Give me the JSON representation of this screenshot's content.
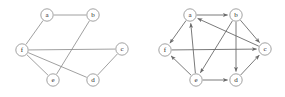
{
  "figure": {
    "width": 285,
    "height": 97,
    "background_color": "#ffffff",
    "edge_color": "#888888",
    "node_fill_color": "#ffffff",
    "node_stroke_color": "#8a8a8a",
    "label_color": "#2a2a2a",
    "node_radius": 6.2
  },
  "chart_data": {
    "type": "diagram",
    "panels": [
      {
        "id": "left",
        "name": "undirected-graph",
        "directed": false,
        "nodes": [
          {
            "id": "a",
            "label": "a",
            "x": 47,
            "y": 15
          },
          {
            "id": "b",
            "label": "b",
            "x": 93,
            "y": 15
          },
          {
            "id": "c",
            "label": "c",
            "x": 122,
            "y": 49
          },
          {
            "id": "d",
            "label": "d",
            "x": 93,
            "y": 80
          },
          {
            "id": "e",
            "label": "e",
            "x": 53,
            "y": 80
          },
          {
            "id": "f",
            "label": "f",
            "x": 22,
            "y": 50
          }
        ],
        "edges": [
          {
            "from": "a",
            "to": "b"
          },
          {
            "from": "a",
            "to": "f"
          },
          {
            "from": "b",
            "to": "e"
          },
          {
            "from": "f",
            "to": "c"
          },
          {
            "from": "f",
            "to": "e"
          },
          {
            "from": "f",
            "to": "d"
          },
          {
            "from": "c",
            "to": "d"
          }
        ]
      },
      {
        "id": "right",
        "name": "directed-graph",
        "directed": true,
        "nodes": [
          {
            "id": "a",
            "label": "a",
            "x": 190,
            "y": 15
          },
          {
            "id": "b",
            "label": "b",
            "x": 236,
            "y": 15
          },
          {
            "id": "c",
            "label": "c",
            "x": 265,
            "y": 49
          },
          {
            "id": "d",
            "label": "d",
            "x": 236,
            "y": 80
          },
          {
            "id": "e",
            "label": "e",
            "x": 196,
            "y": 80
          },
          {
            "id": "f",
            "label": "f",
            "x": 165,
            "y": 50
          }
        ],
        "edges": [
          {
            "from": "a",
            "to": "b"
          },
          {
            "from": "a",
            "to": "f"
          },
          {
            "from": "e",
            "to": "a"
          },
          {
            "from": "c",
            "to": "a"
          },
          {
            "from": "b",
            "to": "c"
          },
          {
            "from": "b",
            "to": "e"
          },
          {
            "from": "b",
            "to": "d"
          },
          {
            "from": "f",
            "to": "c"
          },
          {
            "from": "e",
            "to": "f"
          },
          {
            "from": "e",
            "to": "d"
          },
          {
            "from": "d",
            "to": "c"
          }
        ]
      }
    ]
  }
}
